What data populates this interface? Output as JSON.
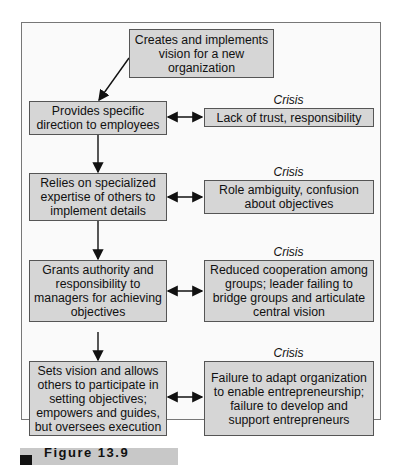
{
  "diagram": {
    "top": {
      "text": "Creates and implements vision for a new organization"
    },
    "stages": [
      {
        "text": "Provides specific direction to employees",
        "crisis_label": "Crisis",
        "crisis": "Lack of trust, responsibility"
      },
      {
        "text": "Relies on specialized expertise of others to implement details",
        "crisis_label": "Crisis",
        "crisis": "Role ambiguity, confusion about objectives"
      },
      {
        "text": "Grants authority and responsibility to managers for achieving objectives",
        "crisis_label": "Crisis",
        "crisis": "Reduced cooperation among groups; leader failing to bridge groups and articulate central vision"
      },
      {
        "text": "Sets vision and allows others to participate in setting objectives; empowers and guides, but oversees execution",
        "crisis_label": "Crisis",
        "crisis": "Failure to adapt organization to enable entrepreneurship; failure to develop and support entrepreneurs"
      }
    ]
  },
  "caption": {
    "label": "Figure 13.9"
  },
  "colors": {
    "box_fill": "#d6d6d6",
    "border": "#555555",
    "caption_bar": "#c8c8c8"
  }
}
